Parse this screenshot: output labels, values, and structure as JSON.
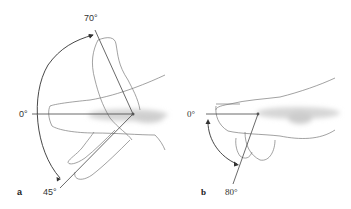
{
  "figure": {
    "panels": [
      {
        "id": "a",
        "label": "a",
        "angles": {
          "neutral": "0°",
          "extension": "70°",
          "flexion": "45°"
        }
      },
      {
        "id": "b",
        "label": "b",
        "angles": {
          "neutral": "0°",
          "flexion": "80°"
        }
      }
    ],
    "colors": {
      "line": "#444444",
      "outline": "#7a7a7a",
      "shading": "#d8d8d8",
      "background": "#ffffff"
    }
  }
}
